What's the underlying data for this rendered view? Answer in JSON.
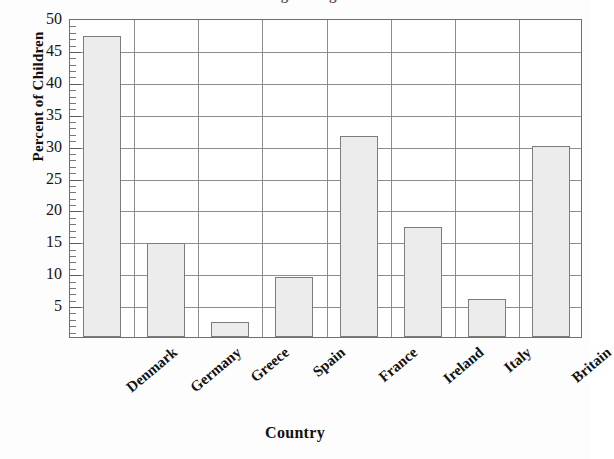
{
  "chart_data": {
    "type": "bar",
    "title": "Percent of Children Living in Single-Parent Households",
    "title_visible": false,
    "xlabel": "Country",
    "ylabel": "Percent of Children",
    "categories": [
      "Denmark",
      "Germany",
      "Greece",
      "Spain",
      "France",
      "Ireland",
      "Italy",
      "Britain"
    ],
    "values": [
      47.2,
      14.7,
      2.3,
      9.4,
      31.5,
      17.2,
      6.0,
      30.0
    ],
    "ylim": [
      0,
      50
    ],
    "ytick_labels": [
      "50",
      "45",
      "40",
      "35",
      "30",
      "25",
      "20",
      "15",
      "10",
      "5"
    ],
    "ytick_values": [
      50,
      45,
      40,
      35,
      30,
      25,
      20,
      15,
      10,
      5
    ],
    "ytick_major_step": 5,
    "ytick_minor_step": 1,
    "grid": "both",
    "legend": "none",
    "bar_fill": "#ececec",
    "bar_edge": "#7c7c7c",
    "grid_color": "#8d8d8d",
    "axis_color": "#6f6f6f",
    "background": "#fdfdfd"
  }
}
